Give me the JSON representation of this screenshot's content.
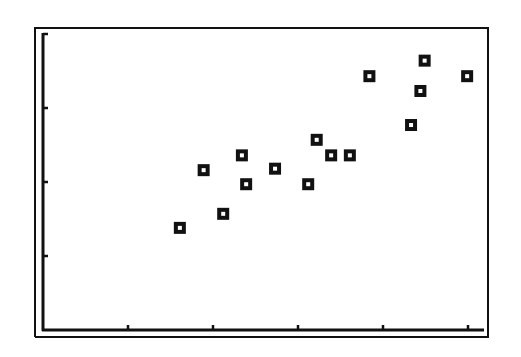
{
  "chart_data": {
    "type": "scatter",
    "title": "",
    "xlabel": "",
    "ylabel": "",
    "xlim": [
      0,
      5.3
    ],
    "ylim": [
      0,
      4.05
    ],
    "x_ticks": [
      1,
      2,
      3,
      4,
      5
    ],
    "y_ticks": [
      1,
      2,
      3,
      4
    ],
    "tick_labels_shown": false,
    "grid": false,
    "legend": null,
    "marker": "hollow-square",
    "series": [
      {
        "name": "data",
        "points": [
          {
            "x": 1.61,
            "y": 1.38
          },
          {
            "x": 1.89,
            "y": 2.16
          },
          {
            "x": 2.12,
            "y": 1.57
          },
          {
            "x": 2.34,
            "y": 2.36
          },
          {
            "x": 2.39,
            "y": 1.97
          },
          {
            "x": 2.73,
            "y": 2.18
          },
          {
            "x": 3.12,
            "y": 1.97
          },
          {
            "x": 3.22,
            "y": 2.57
          },
          {
            "x": 3.39,
            "y": 2.36
          },
          {
            "x": 3.61,
            "y": 2.36
          },
          {
            "x": 3.84,
            "y": 3.43
          },
          {
            "x": 4.33,
            "y": 2.77
          },
          {
            "x": 4.44,
            "y": 3.23
          },
          {
            "x": 4.49,
            "y": 3.64
          },
          {
            "x": 4.99,
            "y": 3.43
          }
        ]
      }
    ]
  },
  "colors": {
    "ink": "#111111",
    "background": "#ffffff"
  }
}
